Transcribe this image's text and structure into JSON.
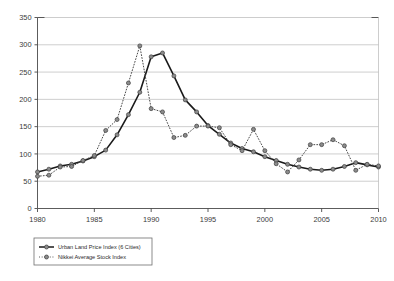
{
  "chart_data": {
    "type": "line",
    "title": "",
    "xlabel": "",
    "ylabel": "",
    "xlim": [
      1980,
      2010
    ],
    "ylim": [
      0,
      350
    ],
    "yticks": [
      0,
      50,
      100,
      150,
      200,
      250,
      300,
      350
    ],
    "xticks": [
      1980,
      1985,
      1990,
      1995,
      2000,
      2005,
      2010
    ],
    "xtick_labels": [
      "1980",
      "1985",
      "1990",
      "1995",
      "2000",
      "2005",
      "2010"
    ],
    "ytick_labels": [
      "0",
      "50",
      "100",
      "150",
      "200",
      "250",
      "300",
      "350"
    ],
    "grid": "horizontal",
    "legend_position": "below-left",
    "x": [
      1980,
      1981,
      1982,
      1983,
      1984,
      1985,
      1986,
      1987,
      1988,
      1989,
      1990,
      1991,
      1992,
      1993,
      1994,
      1995,
      1996,
      1997,
      1998,
      1999,
      2000,
      2001,
      2002,
      2003,
      2004,
      2005,
      2006,
      2007,
      2008,
      2009,
      2010
    ],
    "series": [
      {
        "name": "Urban Land Price Index (6 Cities)",
        "style": "solid",
        "color": "#1a1a1a",
        "marker": "circle",
        "marker_color": "#8c8c8c",
        "values": [
          67,
          72,
          78,
          81,
          87,
          95,
          107,
          135,
          172,
          213,
          278,
          285,
          243,
          199,
          177,
          152,
          136,
          120,
          110,
          104,
          95,
          88,
          81,
          76,
          72,
          70,
          72,
          77,
          84,
          80,
          76
        ]
      },
      {
        "name": "Nikkei Average Stock Index",
        "style": "dotted",
        "color": "#4a4a4a",
        "marker": "circle",
        "marker_color": "#8c8c8c",
        "values": [
          59,
          61,
          76,
          77,
          88,
          97,
          143,
          163,
          230,
          298,
          183,
          177,
          130,
          134,
          151,
          151,
          148,
          117,
          106,
          145,
          106,
          82,
          67,
          89,
          117,
          117,
          126,
          115,
          70,
          81,
          78
        ]
      }
    ]
  },
  "legend": {
    "entries": [
      {
        "label": "Urban Land Price Index (6 Cities)"
      },
      {
        "label": "Nikkei Average Stock Index"
      }
    ]
  }
}
